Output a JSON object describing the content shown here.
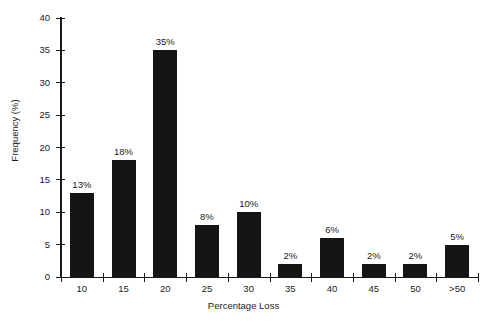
{
  "chart_data": {
    "type": "bar",
    "title": "",
    "subtitle": "",
    "xlabel": "Percentage Loss",
    "ylabel": "Frequency (%)",
    "categories": [
      "10",
      "15",
      "20",
      "25",
      "30",
      "35",
      "40",
      "45",
      "50",
      ">50"
    ],
    "values": [
      13,
      18,
      35,
      8,
      10,
      2,
      6,
      2,
      2,
      5
    ],
    "point_labels": [
      "13%",
      "18%",
      "35%",
      "8%",
      "10%",
      "2%",
      "6%",
      "2%",
      "2%",
      "5%"
    ],
    "ylim": [
      0,
      40
    ],
    "ytick_values": [
      0,
      5,
      10,
      15,
      20,
      25,
      30,
      35,
      40
    ],
    "ytick_labels": [
      "0",
      "5",
      "10",
      "15",
      "20",
      "25",
      "30",
      "35",
      "40"
    ],
    "grid": false,
    "legend": false,
    "legend_position": "none",
    "series": [
      {
        "name": "Frequency",
        "values": [
          13,
          18,
          35,
          8,
          10,
          2,
          6,
          2,
          2,
          5
        ]
      }
    ],
    "colors": {
      "bar": "#151515",
      "axis": "#1a1a1a",
      "text": "#1a1a1a",
      "background": "#ffffff"
    }
  }
}
